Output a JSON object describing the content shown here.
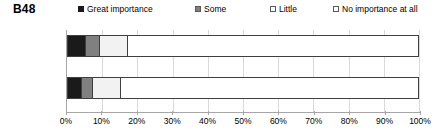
{
  "chart_data": {
    "type": "bar",
    "title": "B48",
    "subtitle": "",
    "xlabel": "",
    "ylabel": "",
    "orientation": "horizontal",
    "stacked": true,
    "normalized_percent": true,
    "xlim": [
      0,
      100
    ],
    "xtick_labels": [
      "0%",
      "10%",
      "20%",
      "30%",
      "40%",
      "50%",
      "60%",
      "70%",
      "80%",
      "90%",
      "100%"
    ],
    "xtick_values": [
      0,
      10,
      20,
      30,
      40,
      50,
      60,
      70,
      80,
      90,
      100
    ],
    "grid": true,
    "legend_position": "top",
    "categories": [
      "Montpellier",
      "Lyon"
    ],
    "category_labels": [
      {
        "name": "Montpellier",
        "n": "(N=308)"
      },
      {
        "name": "Lyon",
        "n": "(N=424)"
      }
    ],
    "series": [
      {
        "name": "Great importance",
        "color": "#1a1a1a",
        "values": [
          5,
          4
        ]
      },
      {
        "name": "Some",
        "color": "#808080",
        "values": [
          4,
          3
        ]
      },
      {
        "name": "Little",
        "color": "#f2f2f2",
        "values": [
          8,
          8
        ]
      },
      {
        "name": "No importance at all",
        "color": "#ffffff",
        "values": [
          83,
          85
        ]
      }
    ]
  },
  "legend": {
    "items": [
      {
        "label": "Great importance",
        "color": "#1a1a1a",
        "border": "#1a1a1a",
        "left": 0
      },
      {
        "label": "Some",
        "color": "#808080",
        "border": "#595959",
        "left": 117
      },
      {
        "label": "Little",
        "color": "#ffffff",
        "border": "#595959",
        "left": 192
      },
      {
        "label": "No importance at all",
        "color": "#ffffff",
        "border": "#595959",
        "left": 255
      }
    ]
  },
  "colors": {
    "axis": "#a6a6a6",
    "grid": "#d9d9d9",
    "bar_outline": "#3f3f3f",
    "text": "#000000"
  }
}
